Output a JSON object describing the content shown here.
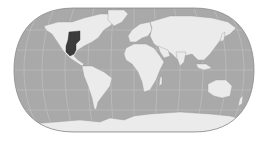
{
  "map": {
    "projection": "eckert-iv-like",
    "colors": {
      "background": "#ffffff",
      "ocean": "#a9a9a9",
      "land": "#ebebeb",
      "highlight": "#3c3c3c",
      "graticule": "#c4c4c4",
      "outline": "#8c8c8c"
    },
    "highlighted_region": "central-north-america"
  }
}
